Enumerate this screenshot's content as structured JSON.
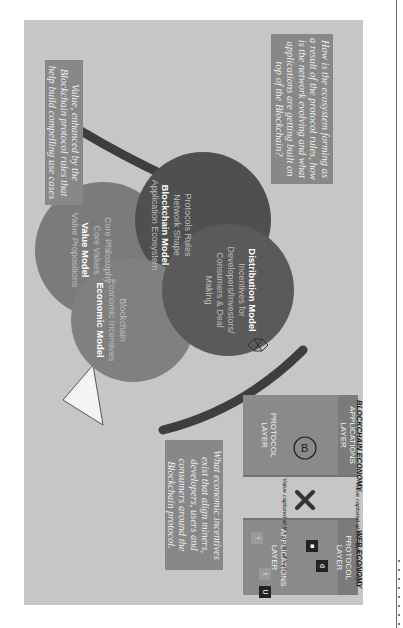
{
  "figure": {
    "orientation": "rotated-90-clockwise",
    "colors": {
      "background": "#c6c6c6",
      "value_circle": "#7b7b7b",
      "blockchain_circle": "#4f4f4f",
      "economic_circle": "#808080",
      "distribution_circle": "#5a5a5a",
      "question_box": "#888888",
      "arrow_arc": "#3e3e3e",
      "arrow_head": "#f4f4f4"
    },
    "questions": {
      "value": "Value, enhanced by the Blockchain protocol rules that help build compelling use cases",
      "ecosystem": "How is the ecosystem forming as a result of the protocol rules, how is the network evolving and what applications are getting built on top of the Blockchain?",
      "incentives": "What economic incentives exist that align miners, developers, users and consumers around the Blockchain protocol."
    },
    "circles": {
      "value": {
        "title": "Value Model",
        "items": [
          "Core Philosophy",
          "Core Values",
          "Value Propositions"
        ],
        "icon": "hand-sparkle-icon"
      },
      "blockchain": {
        "title": "Blockchain Model",
        "items": [
          "Protocols Rules",
          "Network Shape",
          "Application Ecosystem"
        ],
        "icon": "network-nodes-icon"
      },
      "economic": {
        "title": "Economic Model",
        "items": [
          "Blockchain",
          "Economic Incentives"
        ],
        "icon": "bar-chart-star-icon"
      },
      "distribution": {
        "title": "Distribution Model",
        "items": [
          "Incentives for Developers/Investors/ Consumers & Deal Making"
        ],
        "icon": "touch-chart-icon"
      }
    },
    "diamond_icon": "diamond-icon",
    "web_economy": {
      "label": "WEB ECONOMY",
      "applications_layer": "APPLICATIONS LAYER",
      "protocol_layer": "PROTOCOL LAYER",
      "caption": "Value captured at the applications layer",
      "app_icons": [
        "twitter-icon",
        "facebook-icon",
        "app-icon",
        "uber-icon",
        "app-icon-2"
      ]
    },
    "blockchain_economy": {
      "label": "BLOCKCHAIN ECONOMY",
      "protocol_layer": "PROTOCOL LAYER",
      "applications_layer": "APPLICATIONS LAYER",
      "caption": "Value captured at the protocol layer",
      "coin_icon": "bitcoin-icon"
    },
    "comparison_symbol": "x-icon"
  }
}
